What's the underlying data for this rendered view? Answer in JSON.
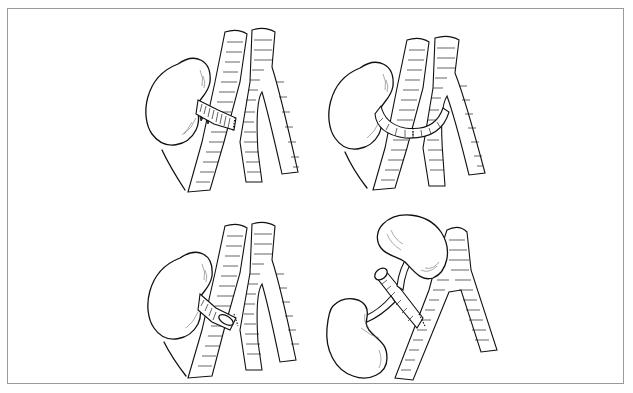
{
  "figure": {
    "type": "medical line illustration",
    "layout": "2x2 grid",
    "border_color": "#9a9a9a",
    "background": "#ffffff",
    "ink_color": "#111111",
    "panels": [
      {
        "id": "top-left",
        "depicts": "kidney with renal vein/artery anastomosed end-to-side to iliac vessels",
        "elements": [
          "kidney",
          "renal-pedicle",
          "iliac-artery",
          "iliac-vein",
          "iliac-bifurcation"
        ]
      },
      {
        "id": "top-right",
        "depicts": "kidney with curved renal vessel looped across to iliac vessels",
        "elements": [
          "kidney",
          "renal-pedicle",
          "iliac-artery",
          "iliac-vein",
          "iliac-bifurcation"
        ]
      },
      {
        "id": "bottom-left",
        "depicts": "kidney with renal artery on aortic patch anastomosed to iliac artery",
        "elements": [
          "kidney",
          "renal-pedicle",
          "aortic-patch",
          "iliac-artery",
          "iliac-vein",
          "iliac-bifurcation"
        ]
      },
      {
        "id": "bottom-right",
        "depicts": "en bloc dual (pediatric) kidneys with donor aorta anastomosed to recipient vessel",
        "elements": [
          "upper-kidney",
          "lower-kidney",
          "donor-aorta-segment",
          "renal-arteries",
          "recipient-iliac-vessel"
        ]
      }
    ]
  }
}
